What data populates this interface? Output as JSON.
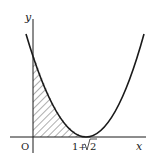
{
  "figure": {
    "type": "function-graph",
    "axes": {
      "x_label": "x",
      "y_label": "y",
      "origin_label": "O"
    },
    "annotations": {
      "vertex_label": "1+√2",
      "vertex_label_prefix": "1+",
      "vertex_label_sqrt_arg": "2"
    },
    "shading": "hatched region from x=0 to x=1+√2 under the curve",
    "colors": {
      "stroke": "#1a1a1a",
      "hatch": "#333333",
      "background": "#ffffff"
    }
  }
}
